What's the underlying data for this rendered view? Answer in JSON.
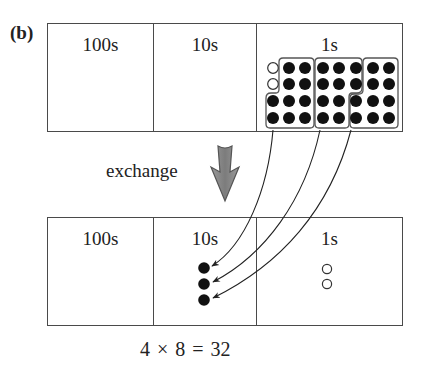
{
  "part_label": "(b)",
  "top_row": {
    "cells": [
      {
        "label": "100s"
      },
      {
        "label": "10s"
      },
      {
        "label": "1s"
      }
    ],
    "ones_grid": {
      "columns": 8,
      "rows": 4,
      "open_counters": 2,
      "filled_counters": 30,
      "groups_of_ten": 3
    }
  },
  "exchange": {
    "label": "exchange",
    "arrow_color": "#8a8a8a"
  },
  "bottom_row": {
    "cells": [
      {
        "label": "100s"
      },
      {
        "label": "10s"
      },
      {
        "label": "1s"
      }
    ],
    "tens_counters": 3,
    "ones_counters": 2
  },
  "equation": "4 × 8 = 32"
}
